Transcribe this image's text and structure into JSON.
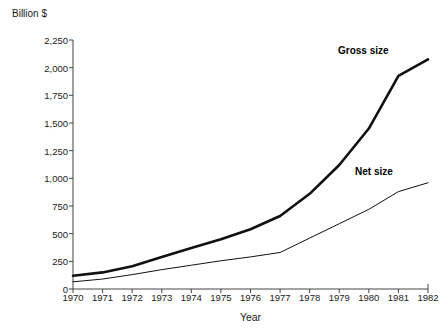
{
  "chart_data": {
    "type": "line",
    "title": "",
    "subtitle": "",
    "xlabel": "Year",
    "ylabel": "Billion $",
    "yunit_label": "Billion $",
    "x": [
      1970,
      1971,
      1972,
      1973,
      1974,
      1975,
      1976,
      1977,
      1978,
      1979,
      1980,
      1981,
      1982
    ],
    "categories": [
      "1970",
      "1971",
      "1972",
      "1973",
      "1974",
      "1975",
      "1976",
      "1977",
      "1978",
      "1979",
      "1980",
      "1981",
      "1982"
    ],
    "yticks": [
      0,
      250,
      500,
      750,
      1000,
      1250,
      1500,
      1750,
      2000,
      2250
    ],
    "ytick_labels": [
      "0",
      "250",
      "500",
      "750",
      "1,000",
      "1,250",
      "1,500",
      "1,750",
      "2,000",
      "2,250"
    ],
    "ylim": [
      0,
      2250
    ],
    "xlim": [
      1970,
      1982
    ],
    "grid": false,
    "legend_position": "inline-annotation",
    "series": [
      {
        "name": "Gross size",
        "label": "Gross size",
        "color": "#111111",
        "line_width": 2.6,
        "values": [
          120,
          150,
          205,
          290,
          370,
          450,
          540,
          660,
          860,
          1120,
          1450,
          1925,
          2075
        ]
      },
      {
        "name": "Net size",
        "label": "Net size",
        "color": "#111111",
        "line_width": 1,
        "values": [
          65,
          90,
          130,
          175,
          215,
          255,
          290,
          330,
          460,
          590,
          720,
          880,
          960
        ]
      }
    ],
    "annotations": [
      {
        "text": "Gross size",
        "for_series": "Gross size"
      },
      {
        "text": "Net size",
        "for_series": "Net size"
      }
    ]
  },
  "axis": {
    "unit_label": "Billion $",
    "x_title": "Year"
  },
  "colors": {
    "axis": "#444444",
    "text": "#1a1a1a",
    "series": "#111111",
    "background": "#ffffff"
  }
}
